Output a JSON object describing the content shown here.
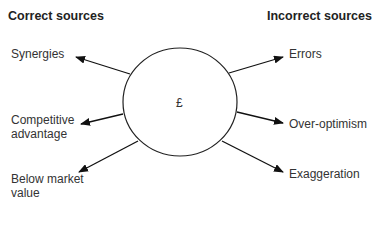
{
  "headers": {
    "left": "Correct sources",
    "right": "Incorrect sources"
  },
  "center": {
    "symbol": "£"
  },
  "correct_sources": [
    {
      "label": "Synergies"
    },
    {
      "label": "Competitive advantage",
      "line1": "Competitive",
      "line2": "advantage"
    },
    {
      "label": "Below market value",
      "line1": "Below market",
      "line2": "value"
    }
  ],
  "incorrect_sources": [
    {
      "label": "Errors"
    },
    {
      "label": "Over-optimism"
    },
    {
      "label": "Exaggeration"
    }
  ]
}
